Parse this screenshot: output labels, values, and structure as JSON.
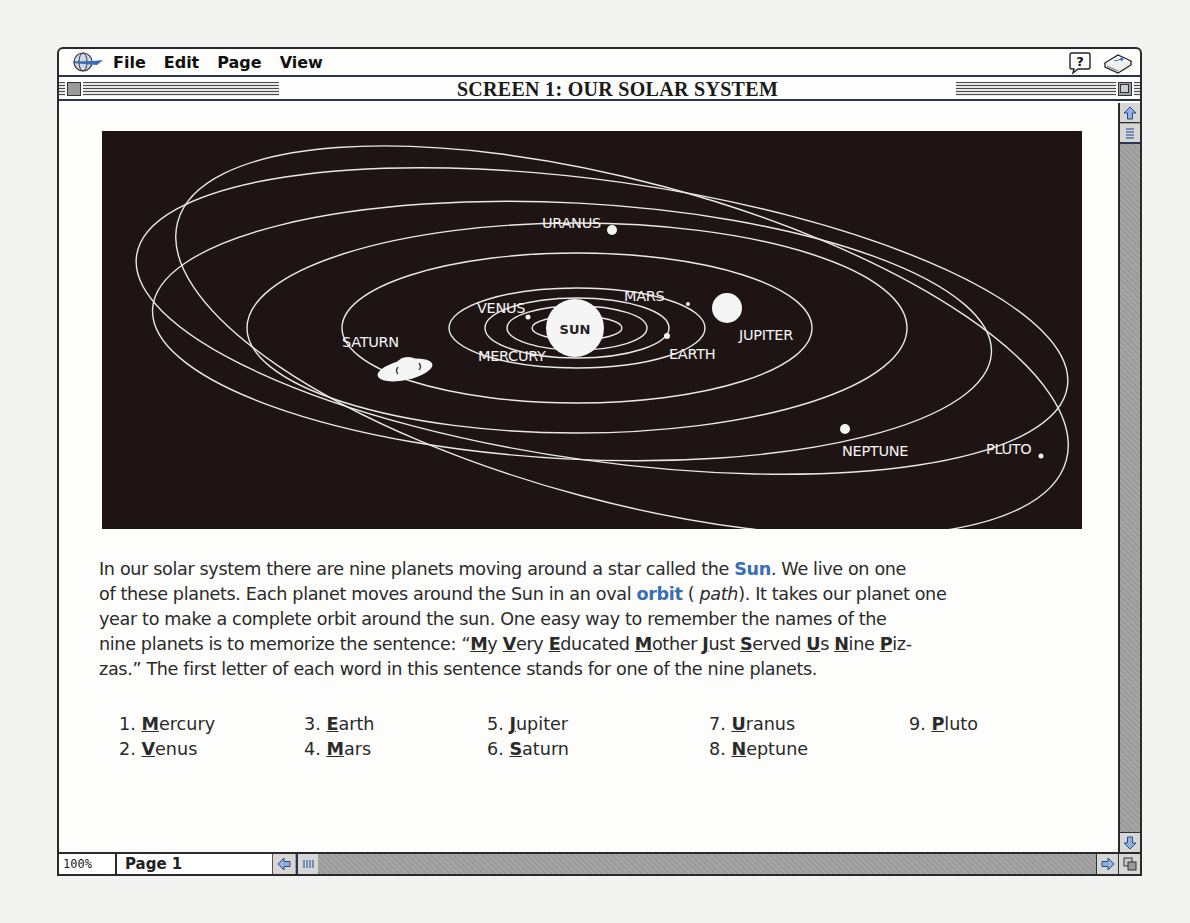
{
  "menubar": {
    "items": [
      "File",
      "Edit",
      "Page",
      "View"
    ],
    "help_icon": "help-balloon-icon",
    "book_icon": "book-icon"
  },
  "window": {
    "title": "SCREEN 1: OUR SOLAR SYSTEM"
  },
  "diagram": {
    "labels": {
      "sun": "SUN",
      "mercury": "MERCURY",
      "venus": "VENUS",
      "earth": "EARTH",
      "mars": "MARS",
      "jupiter": "JUPITER",
      "saturn": "SATURN",
      "uranus": "URANUS",
      "neptune": "NEPTUNE",
      "pluto": "PLUTO"
    },
    "colors": {
      "background": "#1f1414",
      "orbit": "#e8e8e8",
      "planet": "#f5f5f5"
    }
  },
  "body": {
    "line1_a": "In our solar system there are nine planets moving around a star called the ",
    "line1_kw": "Sun",
    "line1_b": ". We live on one",
    "line2_a": "of these planets. Each planet moves around the Sun in an oval ",
    "line2_kw": "orbit",
    "line2_b": " ( ",
    "line2_it": "path",
    "line2_c": "). It takes our planet one",
    "line3": "year to make a complete orbit around the sun. One easy way to remember the names of the",
    "line4_prefix": "nine planets is to memorize the sentence: “",
    "mnemonic": [
      {
        "i": "M",
        "r": "y "
      },
      {
        "i": "V",
        "r": "ery "
      },
      {
        "i": "E",
        "r": "ducated "
      },
      {
        "i": "M",
        "r": "other "
      },
      {
        "i": "J",
        "r": "ust "
      },
      {
        "i": "S",
        "r": "erved "
      },
      {
        "i": "U",
        "r": "s "
      },
      {
        "i": "N",
        "r": "ine "
      },
      {
        "i": "P",
        "r": "iz-"
      }
    ],
    "line5": "zas.” The first letter of each word in this sentence stands for one of the nine planets.",
    "keyword_color": "#3a6db5"
  },
  "planet_list": [
    {
      "num": "1. ",
      "init": "M",
      "rest": "ercury"
    },
    {
      "num": "2. ",
      "init": "V",
      "rest": "enus"
    },
    {
      "num": "3. ",
      "init": "E",
      "rest": "arth"
    },
    {
      "num": "4. ",
      "init": "M",
      "rest": "ars"
    },
    {
      "num": "5. ",
      "init": "J",
      "rest": "upiter"
    },
    {
      "num": "6. ",
      "init": "S",
      "rest": "aturn"
    },
    {
      "num": "7. ",
      "init": "U",
      "rest": "ranus"
    },
    {
      "num": "8. ",
      "init": "N",
      "rest": "eptune"
    },
    {
      "num": "9. ",
      "init": "P",
      "rest": "luto"
    }
  ],
  "statusbar": {
    "zoom": "100%",
    "page": "Page 1"
  }
}
